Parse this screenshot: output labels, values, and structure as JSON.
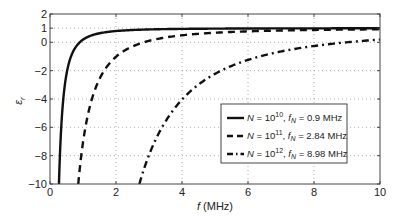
{
  "chart_data": {
    "type": "line",
    "title": "",
    "xlabel": "f (MHz)",
    "ylabel": "ε_r",
    "xlim": [
      0,
      10
    ],
    "ylim": [
      -10,
      2
    ],
    "xticks": [
      0,
      2,
      4,
      6,
      8,
      10
    ],
    "yticks": [
      -10,
      -8,
      -6,
      -4,
      -2,
      0,
      1,
      2
    ],
    "grid": true,
    "legend_position": "lower right",
    "formula": "eps_r = 1 - fN^2 / f^2",
    "series": [
      {
        "name": "N = 10^10, f_N = 0.9 MHz",
        "N_exp": "10",
        "fN": 0.9,
        "fN_label": "0.9 MHz",
        "style": "solid",
        "x": [
          0.28,
          0.3,
          0.35,
          0.4,
          0.5,
          0.6,
          0.8,
          1,
          1.5,
          2,
          3,
          4,
          6,
          8,
          10
        ],
        "values": [
          -9.33,
          -8.0,
          -5.61,
          -4.06,
          -2.24,
          -1.25,
          -0.27,
          0.19,
          0.64,
          0.8,
          0.91,
          0.95,
          0.98,
          0.99,
          0.99
        ]
      },
      {
        "name": "N = 10^11, f_N = 2.84 MHz",
        "N_exp": "11",
        "fN": 2.84,
        "fN_label": "2.84 MHz",
        "style": "dashed",
        "x": [
          0.86,
          1,
          1.2,
          1.5,
          2,
          2.5,
          3,
          4,
          5,
          6,
          8,
          10
        ],
        "values": [
          -9.9,
          -7.07,
          -4.6,
          -2.58,
          -1.02,
          -0.29,
          0.1,
          0.5,
          0.68,
          0.78,
          0.87,
          0.92
        ]
      },
      {
        "name": "N = 10^12, f_N = 8.98 MHz",
        "N_exp": "12",
        "fN": 8.98,
        "fN_label": "8.98 MHz",
        "style": "dash-dot",
        "x": [
          2.71,
          3,
          3.5,
          4,
          4.5,
          5,
          6,
          7,
          8,
          9,
          10
        ],
        "values": [
          -9.98,
          -7.96,
          -5.58,
          -4.04,
          -2.98,
          -2.23,
          -1.24,
          -0.65,
          -0.26,
          0.0,
          0.19
        ]
      }
    ]
  },
  "axis": {
    "xlabel_italic": "f",
    "xlabel_rest": " (MHz)",
    "ylabel_main": "ε",
    "ylabel_sub": "r"
  },
  "legend": {
    "items": [
      {
        "N_base": "N = 10",
        "N_exp": "10",
        "sep": ", ",
        "f": "f",
        "sub": "N",
        "val": " = 0.9 MHz"
      },
      {
        "N_base": "N = 10",
        "N_exp": "11",
        "sep": ", ",
        "f": "f",
        "sub": "N",
        "val": " = 2.84 MHz"
      },
      {
        "N_base": "N = 10",
        "N_exp": "12",
        "sep": ", ",
        "f": "f",
        "sub": "N",
        "val": " = 8.98 MHz"
      }
    ]
  }
}
